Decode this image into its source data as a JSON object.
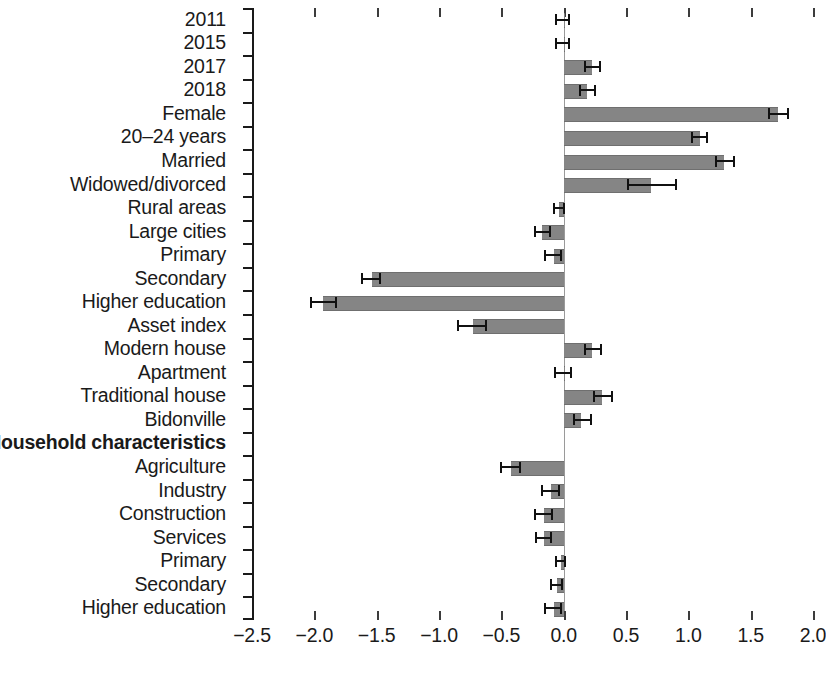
{
  "chart_data": {
    "type": "bar",
    "orientation": "horizontal",
    "title": "",
    "xlabel": "",
    "ylabel": "",
    "xlim": [
      -2.5,
      2.0
    ],
    "grid": false,
    "legend": null,
    "xticks": [
      "-2.5",
      "-2.0",
      "-1.5",
      "-1.0",
      "-0.5",
      "0.0",
      "0.5",
      "1.0",
      "1.5",
      "2.0"
    ],
    "xtick_values": [
      -2.5,
      -2.0,
      -1.5,
      -1.0,
      -0.5,
      0.0,
      0.5,
      1.0,
      1.5,
      2.0
    ],
    "zero_reference_line": 0.0,
    "bar_color": "#858585",
    "errorbar_color": "#111111",
    "categories": [
      "2011",
      "2015",
      "2017",
      "2018",
      "Female",
      "20–24 years",
      "Married",
      "Widowed/divorced",
      "Rural areas",
      "Large cities",
      "Primary",
      "Secondary",
      "Higher education",
      "Asset index",
      "Modern house",
      "Apartment",
      "Traditional house",
      "Bidonville",
      "Household characteristics",
      "Agriculture",
      "Industry",
      "Construction",
      "Services",
      "Primary",
      "Secondary",
      "Higher education"
    ],
    "rows": [
      {
        "label": "2011",
        "value": 0.0,
        "ci_low": -0.06,
        "ci_high": 0.04,
        "header": false
      },
      {
        "label": "2015",
        "value": 0.0,
        "ci_low": -0.06,
        "ci_high": 0.04,
        "header": false
      },
      {
        "label": "2017",
        "value": 0.23,
        "ci_low": 0.17,
        "ci_high": 0.29,
        "header": false
      },
      {
        "label": "2018",
        "value": 0.19,
        "ci_low": 0.13,
        "ci_high": 0.25,
        "header": false
      },
      {
        "label": "Female",
        "value": 1.72,
        "ci_low": 1.65,
        "ci_high": 1.8,
        "header": false
      },
      {
        "label": "20–24 years",
        "value": 1.09,
        "ci_low": 1.03,
        "ci_high": 1.15,
        "header": false
      },
      {
        "label": "Married",
        "value": 1.29,
        "ci_low": 1.22,
        "ci_high": 1.37,
        "header": false
      },
      {
        "label": "Widowed/divorced",
        "value": 0.7,
        "ci_low": 0.52,
        "ci_high": 0.9,
        "header": false
      },
      {
        "label": "Rural areas",
        "value": -0.04,
        "ci_low": -0.08,
        "ci_high": 0.0,
        "header": false
      },
      {
        "label": "Large cities",
        "value": -0.17,
        "ci_low": -0.23,
        "ci_high": -0.11,
        "header": false
      },
      {
        "label": "Primary",
        "value": -0.08,
        "ci_low": -0.15,
        "ci_high": -0.02,
        "header": false
      },
      {
        "label": "Secondary",
        "value": -1.54,
        "ci_low": -1.62,
        "ci_high": -1.47,
        "header": false
      },
      {
        "label": "Higher education",
        "value": -1.93,
        "ci_low": -2.03,
        "ci_high": -1.83,
        "header": false
      },
      {
        "label": "Asset index",
        "value": -0.73,
        "ci_low": -0.85,
        "ci_high": -0.62,
        "header": false
      },
      {
        "label": "Modern house",
        "value": 0.23,
        "ci_low": 0.17,
        "ci_high": 0.3,
        "header": false
      },
      {
        "label": "Apartment",
        "value": 0.0,
        "ci_low": -0.07,
        "ci_high": 0.06,
        "header": false
      },
      {
        "label": "Traditional house",
        "value": 0.31,
        "ci_low": 0.24,
        "ci_high": 0.39,
        "header": false
      },
      {
        "label": "Bidonville",
        "value": 0.14,
        "ci_low": 0.08,
        "ci_high": 0.22,
        "header": false
      },
      {
        "label": "Household characteristics",
        "value": null,
        "ci_low": null,
        "ci_high": null,
        "header": true
      },
      {
        "label": "Agriculture",
        "value": -0.42,
        "ci_low": -0.5,
        "ci_high": -0.35,
        "header": false
      },
      {
        "label": "Industry",
        "value": -0.1,
        "ci_low": -0.17,
        "ci_high": -0.04,
        "header": false
      },
      {
        "label": "Construction",
        "value": -0.16,
        "ci_low": -0.23,
        "ci_high": -0.09,
        "header": false
      },
      {
        "label": "Services",
        "value": -0.16,
        "ci_low": -0.22,
        "ci_high": -0.1,
        "header": false
      },
      {
        "label": "Primary",
        "value": -0.02,
        "ci_low": -0.06,
        "ci_high": 0.01,
        "header": false
      },
      {
        "label": "Secondary",
        "value": -0.05,
        "ci_low": -0.1,
        "ci_high": -0.01,
        "header": false
      },
      {
        "label": "Higher education",
        "value": -0.08,
        "ci_low": -0.15,
        "ci_high": -0.02,
        "header": false
      }
    ]
  }
}
